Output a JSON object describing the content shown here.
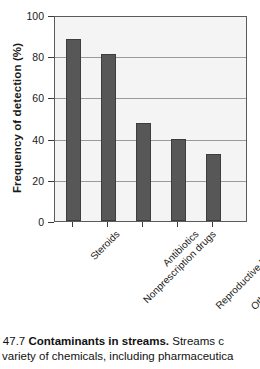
{
  "chart_data": {
    "type": "bar",
    "title": "",
    "xlabel": "",
    "ylabel": "Frequency of detection (%)",
    "categories": [
      "Steroids",
      "Nonprescription drugs",
      "Antibiotics",
      "Reproductive hormones",
      "Other prescription drugs"
    ],
    "values": [
      89,
      82,
      48,
      40,
      33
    ],
    "ylim": [
      0,
      100
    ],
    "yticks": [
      0,
      20,
      40,
      60,
      80,
      100
    ],
    "ytick_labels": [
      "0",
      "20",
      "40",
      "60",
      "80",
      "100"
    ],
    "grid": true,
    "grid_axis": "y",
    "legend": null,
    "bar_color": "#575757",
    "plot_background": "#f4f4f4",
    "frame_color": "#5b5b5b",
    "gridline_color": "#9a9a9a",
    "label_rotation_deg": -45
  },
  "caption": {
    "figure_number": "E 47.7",
    "figure_title": "Contaminants in streams.",
    "line1_tail": "Streams c",
    "line2": "variety of chemicals, including pharmaceutica"
  }
}
